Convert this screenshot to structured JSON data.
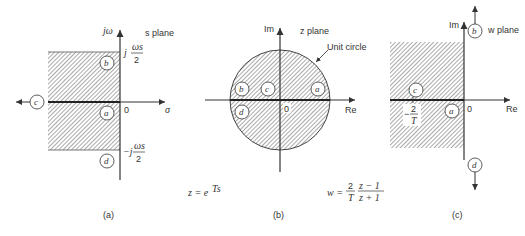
{
  "panels": [
    {
      "id": "a",
      "title": "s plane",
      "caption": "(a)",
      "axes": {
        "vertical": "jω",
        "horizontal": "σ",
        "origin": "0"
      },
      "bounds": {
        "upper": {
          "prefix": "j",
          "num": "ωs",
          "den": "2"
        },
        "lower": {
          "prefix": "−j",
          "num": "ωs",
          "den": "2"
        }
      },
      "points": {
        "a": "a",
        "b": "b",
        "c": "c",
        "d": "d"
      }
    },
    {
      "id": "b",
      "title": "z plane",
      "caption": "(b)",
      "axes": {
        "vertical": "Im",
        "horizontal": "Re",
        "origin": "0"
      },
      "annotation": "Unit circle",
      "points": {
        "a": "a",
        "b": "b",
        "c": "c",
        "d": "d"
      }
    },
    {
      "id": "c",
      "title": "w plane",
      "caption": "(c)",
      "axes": {
        "vertical": "Im",
        "horizontal": "Re",
        "origin": "0"
      },
      "marker": {
        "prefix": "−",
        "num": "2",
        "den": "T"
      },
      "points": {
        "a": "a",
        "b": "b",
        "c": "c",
        "d": "d"
      }
    }
  ],
  "equations": {
    "z_map": {
      "lhs": "z = e",
      "exp": "Ts"
    },
    "w_map": {
      "lhs": "w =",
      "frac1_num": "2",
      "frac1_den": "T",
      "frac2_num": "z − 1",
      "frac2_den": "z + 1"
    }
  }
}
